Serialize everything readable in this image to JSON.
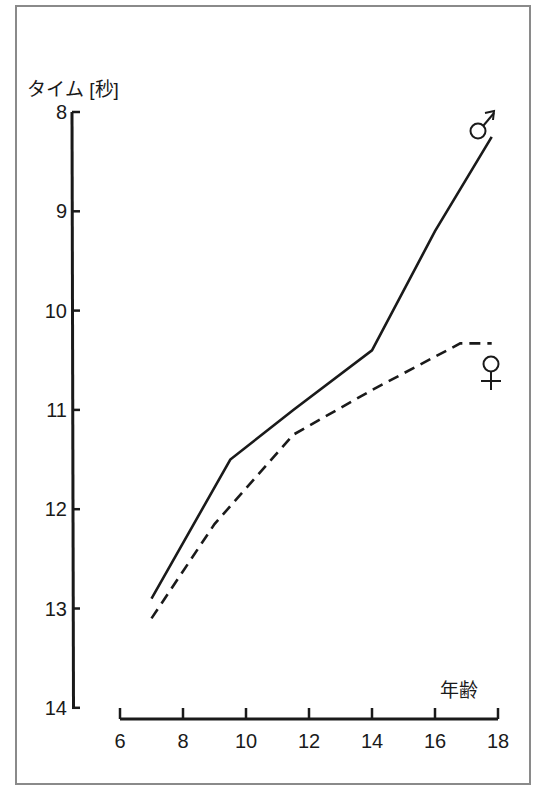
{
  "chart_data": {
    "type": "line",
    "title": "",
    "ylabel": "タイム [秒]",
    "xlabel": "年齢",
    "y_axis": {
      "inverted": true,
      "range": [
        8,
        14
      ],
      "ticks": [
        "8",
        "9",
        "10",
        "11",
        "12",
        "13",
        "14"
      ]
    },
    "x_axis": {
      "range": [
        6,
        18
      ],
      "ticks": [
        "6",
        "8",
        "10",
        "12",
        "14",
        "16",
        "18"
      ]
    },
    "grid": false,
    "legend": "inline symbols at line ends",
    "series": [
      {
        "name": "♂",
        "label": "male",
        "style": "solid",
        "x": [
          7,
          9.5,
          11.5,
          14,
          16,
          17.8
        ],
        "y": [
          12.9,
          11.5,
          11.0,
          10.4,
          9.2,
          8.25
        ]
      },
      {
        "name": "♀",
        "label": "female",
        "style": "dashed",
        "x": [
          7,
          9,
          11.5,
          14,
          16.8,
          17.8
        ],
        "y": [
          13.1,
          12.15,
          11.25,
          10.8,
          10.33,
          10.33
        ]
      }
    ]
  },
  "labels": {
    "y_title": "タイム [秒]",
    "x_title": "年齢",
    "male_symbol": "♂",
    "female_symbol": "♀"
  },
  "colors": {
    "line": "#1a1a1a",
    "frame": "#8a8a8a",
    "background": "#ffffff"
  }
}
